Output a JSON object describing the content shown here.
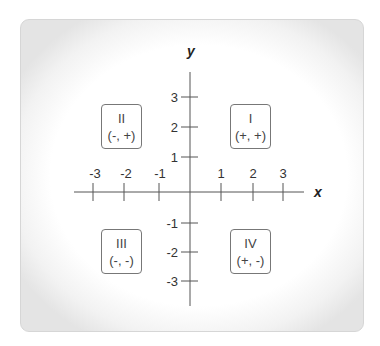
{
  "diagram": {
    "axes": {
      "x_label": "x",
      "y_label": "y",
      "x_ticks": [
        "-3",
        "-2",
        "-1",
        "1",
        "2",
        "3"
      ],
      "y_ticks": [
        "3",
        "2",
        "1",
        "-1",
        "-2",
        "-3"
      ]
    },
    "quadrants": [
      {
        "numeral": "I",
        "signs": "(+, +)"
      },
      {
        "numeral": "II",
        "signs": "(-, +)"
      },
      {
        "numeral": "III",
        "signs": "(-, -)"
      },
      {
        "numeral": "IV",
        "signs": "(+, -)"
      }
    ],
    "colors": {
      "axis": "#555555",
      "box_border": "#777777",
      "text": "#333333"
    }
  }
}
